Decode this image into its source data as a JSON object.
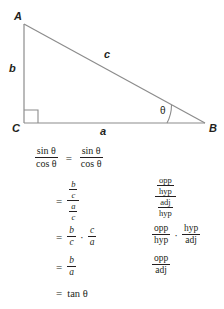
{
  "diagram": {
    "name": "right-triangle-trigonometry-diagram",
    "vertices": [
      {
        "id": "A",
        "label": "A",
        "x": 24,
        "y": 24
      },
      {
        "id": "C",
        "label": "C",
        "x": 24,
        "y": 123
      },
      {
        "id": "B",
        "label": "B",
        "x": 205,
        "y": 123
      }
    ],
    "side_labels": {
      "opposite": "b",
      "hypotenuse": "c",
      "adjacent": "a"
    },
    "angle_label": "θ",
    "right_angle_marker": true,
    "line_color": "#8c8c8c"
  },
  "derivation": {
    "title": "tangent identity derivation",
    "rows": [
      {
        "id": "row1",
        "left": {
          "sign": "",
          "fraction": {
            "num": "sin θ",
            "den": "cos θ"
          },
          "equals": "=",
          "fraction2": {
            "num": "sin θ",
            "den": "cos θ"
          }
        },
        "right": null
      },
      {
        "id": "row2",
        "sign": "=",
        "left_complex": {
          "num_num": "b",
          "num_den": "c",
          "den_num": "a",
          "den_den": "c"
        },
        "right_complex": {
          "num_num": "opp",
          "num_den": "hyp",
          "den_num": "adj",
          "den_den": "hyp"
        }
      },
      {
        "id": "row3",
        "sign": "=",
        "left_first": {
          "num": "b",
          "den": "c"
        },
        "operator": "·",
        "left_second": {
          "num": "c",
          "den": "a"
        },
        "right_first": {
          "num": "opp",
          "den": "hyp"
        },
        "right_second": {
          "num": "hyp",
          "den": "adj"
        }
      },
      {
        "id": "row4",
        "sign": "=",
        "left": {
          "num": "b",
          "den": "a"
        },
        "right": {
          "num": "opp",
          "den": "adj"
        }
      },
      {
        "id": "row5",
        "sign": "=",
        "left_text": "tan θ",
        "right": null
      }
    ]
  }
}
